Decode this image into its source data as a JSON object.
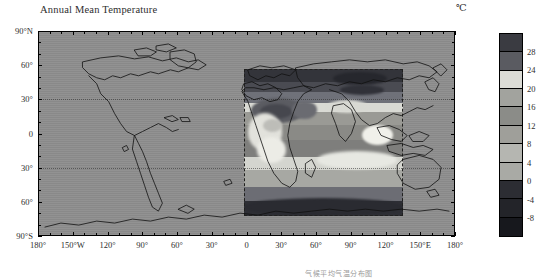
{
  "figure": {
    "title": "Annual Mean Temperature",
    "unit_label": "℃",
    "caption_partial": "气候平均气温分布图"
  },
  "axes": {
    "x_label_values": [
      "180°",
      "150°W",
      "120°",
      "90°",
      "60°",
      "30°",
      "0",
      "30°",
      "60°",
      "90°",
      "120°",
      "150°E",
      "180°"
    ],
    "y_label_values": [
      "90°N",
      "60°",
      "30°",
      "0",
      "30°",
      "60°",
      "90°S"
    ],
    "x_range": [
      -180,
      180
    ],
    "y_range": [
      -90,
      90
    ],
    "x_tick_step_deg": 10,
    "x_label_step_deg": 30,
    "y_label_step_deg": 30
  },
  "colorbar": {
    "unit": "℃",
    "tick_labels": [
      "28",
      "24",
      "20",
      "16",
      "12",
      "8",
      "4",
      "0",
      "-4",
      "-8"
    ],
    "tick_values": [
      28,
      24,
      20,
      16,
      12,
      8,
      4,
      0,
      -4,
      -8
    ],
    "orientation": "vertical",
    "colors": [
      "#3a3b41",
      "#5a5b61",
      "#dcdcd6",
      "#a2a39e",
      "#8b8c88",
      "#9f9f9a",
      "#b5b6b1",
      "#a9aaa5",
      "#2c2d33",
      "#232429",
      "#17181d"
    ]
  },
  "chart_data": {
    "type": "heatmap",
    "title": "Annual Mean Temperature",
    "xlabel": "",
    "ylabel": "",
    "unit": "℃",
    "projection": "cylindrical-equidistant",
    "xlim": [
      -180,
      180
    ],
    "ylim": [
      -90,
      90
    ],
    "grid": false,
    "legend_position": "right",
    "contour_levels": [
      -8,
      -4,
      0,
      4,
      8,
      12,
      16,
      20,
      24,
      28
    ],
    "data_domain": {
      "lon_min": 0,
      "lon_max": 120,
      "lat_min": -60,
      "lat_max": 60,
      "outline": "dashed"
    },
    "zonal_mean_profile": {
      "latitudes": [
        60,
        50,
        40,
        30,
        20,
        10,
        0,
        -10,
        -20,
        -30,
        -40,
        -50,
        -60
      ],
      "values": [
        -8,
        -2,
        8,
        18,
        25,
        27,
        27,
        26,
        22,
        16,
        8,
        0,
        -6
      ]
    },
    "annotations": [
      {
        "text": "℃",
        "position": "top-right"
      },
      {
        "text": "Annual Mean Temperature",
        "position": "top-left"
      }
    ]
  },
  "map_features": {
    "graticule_dotted_latitudes": [
      23.5,
      -23.5
    ],
    "basemap_fill": "#8e8e8e",
    "coastline_color": "#111111"
  }
}
